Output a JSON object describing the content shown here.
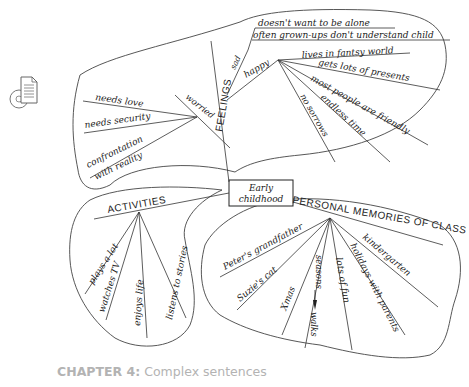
{
  "icon": {
    "name": "cd-document-icon"
  },
  "center": {
    "line1": "Early",
    "line2": "childhood"
  },
  "feelings": {
    "label": "FEELINGS",
    "sad": {
      "label": "sad",
      "items": [
        "doesn't want to be alone",
        "often grown-ups don't understand child"
      ]
    },
    "happy": {
      "label": "happy",
      "items": [
        "lives in fantsy world",
        "gets lots of presents",
        "most people are friendly",
        "endless time",
        "no sorrows"
      ]
    },
    "worried": {
      "label": "worried",
      "items": [
        "needs love",
        "needs security",
        "confrontation",
        "with reality"
      ]
    }
  },
  "activities": {
    "label": "ACTIVITIES",
    "items": [
      "plays a lot",
      "watches TV",
      "enjoys life",
      "listens to stories"
    ]
  },
  "memories": {
    "label": "PERSONAL MEMORIES OF CLASS",
    "items": [
      "Peter's grandfather",
      "Suzie's cat",
      "Xmas",
      "seasons",
      "walks",
      "lots of fun",
      "holidays with parents",
      "kindergarten"
    ]
  },
  "caption": {
    "chapter": "CHAPTER 4:",
    "title": "Complex sentences"
  }
}
